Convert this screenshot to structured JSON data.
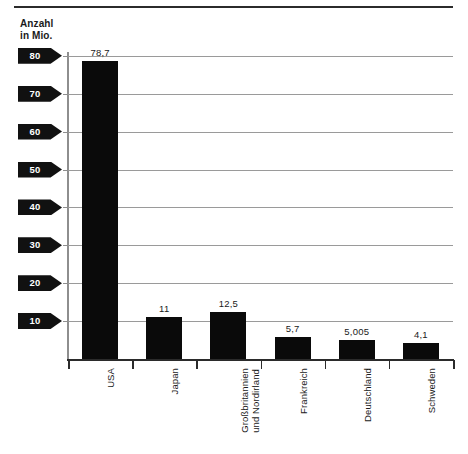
{
  "axis_title": "Anzahl\nin Mio.",
  "chart_data": {
    "type": "bar",
    "title": "",
    "subtitle": "",
    "xlabel": "",
    "ylabel": "Anzahl in Mio.",
    "ylim": [
      0,
      85
    ],
    "grid": true,
    "legend": "none",
    "orientation": "vertical",
    "bar_color": "#0a0a0a",
    "categories": [
      "USA",
      "Japan",
      "Großbritannien\nund Nordirland",
      "Frankreich",
      "Deutschland",
      "Schweden"
    ],
    "values": [
      78.7,
      11,
      12.5,
      5.7,
      5.005,
      4.1
    ],
    "value_labels": [
      "78,7",
      "11",
      "12,5",
      "5,7",
      "5,005",
      "4,1"
    ],
    "ytick_labels": [
      "80",
      "70",
      "60",
      "50",
      "40",
      "30",
      "20",
      "10"
    ],
    "ytick_values": [
      80,
      70,
      60,
      50,
      40,
      30,
      20,
      10
    ]
  }
}
